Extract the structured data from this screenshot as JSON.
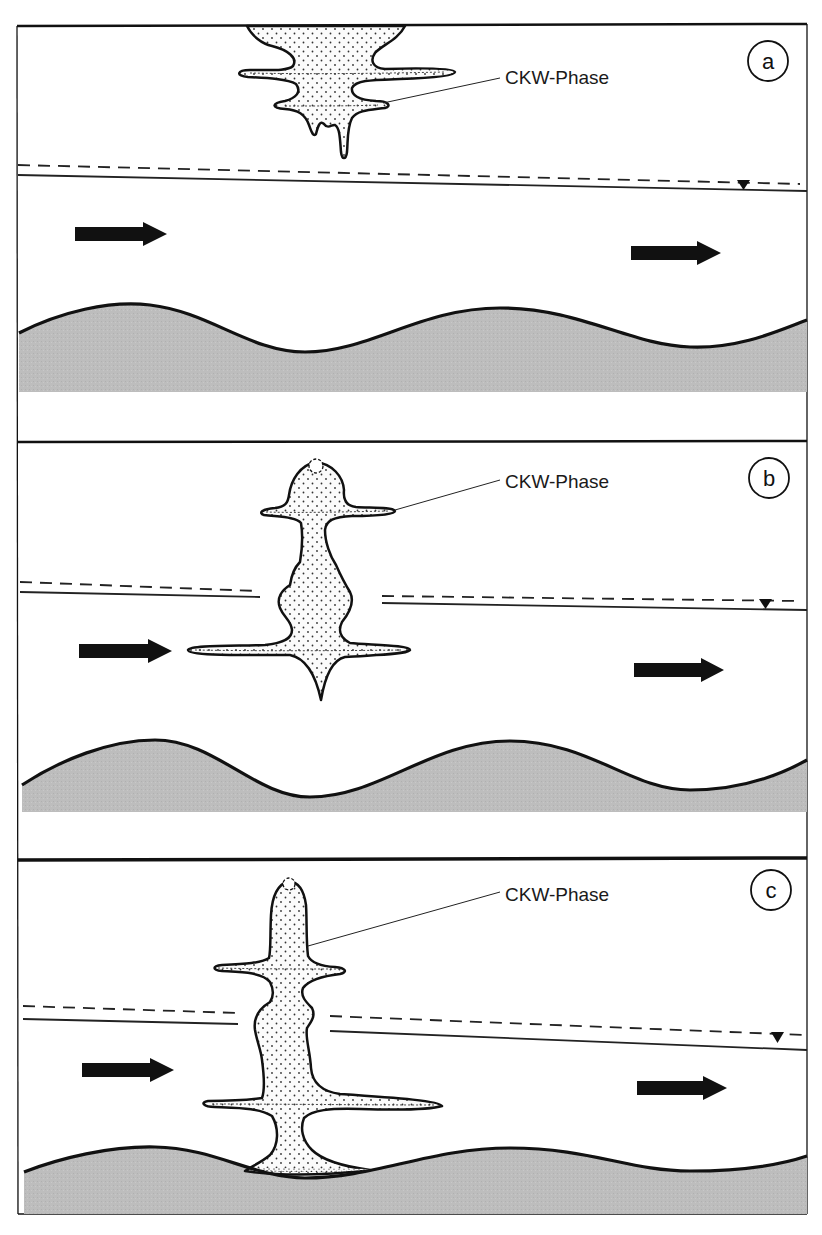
{
  "figure": {
    "type": "groundwater contamination diagram",
    "colors": {
      "background": "#ffffff",
      "ink": "#111111",
      "bedrock": "#bdbdbd",
      "plume_fill": "#fbfbfb",
      "plume_dots": "#333333"
    },
    "legend_marker": "water-table-triangle",
    "panels": [
      {
        "id": "a",
        "letter": "a",
        "label": "CKW-Phase",
        "stage": "plume suspended above water table"
      },
      {
        "id": "b",
        "letter": "b",
        "label": "CKW-Phase",
        "stage": "plume penetrating water table"
      },
      {
        "id": "c",
        "letter": "c",
        "label": "CKW-Phase",
        "stage": "plume reaching bedrock"
      }
    ],
    "icons": {
      "flow_arrow": "arrow-right-icon",
      "water_table": "inverted-triangle-icon",
      "panel_badge": "circle-letter-icon"
    }
  }
}
